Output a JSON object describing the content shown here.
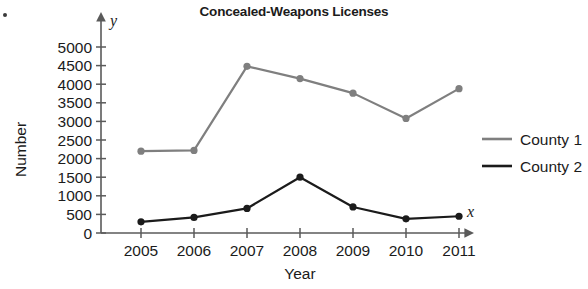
{
  "chart_data": {
    "type": "line",
    "title": "Concealed-Weapons Licenses",
    "xlabel": "Year",
    "ylabel": "Number",
    "x_axis_variable": "x",
    "y_axis_variable": "y",
    "categories": [
      "2005",
      "2006",
      "2007",
      "2008",
      "2009",
      "2010",
      "2011"
    ],
    "xlim": [
      2005,
      2011
    ],
    "ylim": [
      0,
      5000
    ],
    "y_ticks": [
      "0",
      "500",
      "1000",
      "1500",
      "2000",
      "2500",
      "3000",
      "3500",
      "4000",
      "4500",
      "5000"
    ],
    "y_tick_values": [
      0,
      500,
      1000,
      1500,
      2000,
      2500,
      3000,
      3500,
      4000,
      4500,
      5000
    ],
    "grid": false,
    "legend_position": "right",
    "series": [
      {
        "name": "County 1",
        "color": "#7f7f7f",
        "values": [
          2200,
          2220,
          4480,
          4150,
          3760,
          3080,
          3880
        ]
      },
      {
        "name": "County 2",
        "color": "#1b1b1b",
        "values": [
          300,
          420,
          660,
          1500,
          700,
          380,
          450
        ]
      }
    ]
  },
  "legend": {
    "items": [
      {
        "label": "County 1",
        "color": "#7f7f7f"
      },
      {
        "label": "County 2",
        "color": "#1b1b1b"
      }
    ]
  }
}
